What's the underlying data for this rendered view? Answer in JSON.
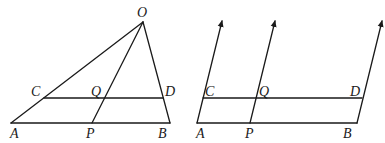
{
  "figures": [
    {
      "id": "left",
      "description": "Triangle OAB with segment CD parallel to AB and cevian OP crossing CD at Q",
      "points": {
        "O": {
          "x": 143,
          "y": 22,
          "label": "O"
        },
        "A": {
          "x": 11,
          "y": 123,
          "label": "A"
        },
        "B": {
          "x": 170,
          "y": 123,
          "label": "B"
        },
        "C": {
          "x": 44,
          "y": 98,
          "label": "C"
        },
        "D": {
          "x": 163,
          "y": 98,
          "label": "D"
        },
        "P": {
          "x": 92,
          "y": 123,
          "label": "P"
        },
        "Q": {
          "x": 104,
          "y": 98,
          "label": "Q"
        }
      },
      "segments": [
        [
          "O",
          "A"
        ],
        [
          "O",
          "B"
        ],
        [
          "O",
          "P"
        ],
        [
          "A",
          "B"
        ],
        [
          "C",
          "D"
        ]
      ]
    },
    {
      "id": "right",
      "description": "Parallel lines AB and CD cut by three parallel rays through A-C, P-Q, B-D",
      "points": {
        "A": {
          "x": 197,
          "y": 123,
          "label": "A"
        },
        "B": {
          "x": 357,
          "y": 123,
          "label": "B"
        },
        "C": {
          "x": 203,
          "y": 98,
          "label": "C"
        },
        "D": {
          "x": 362,
          "y": 98,
          "label": "D"
        },
        "P": {
          "x": 250,
          "y": 123,
          "label": "P"
        },
        "Q": {
          "x": 256,
          "y": 98,
          "label": "Q"
        }
      },
      "segments": [
        [
          "A",
          "B"
        ],
        [
          "C",
          "D"
        ]
      ],
      "rays": [
        {
          "from": "A",
          "tip": {
            "x": 222,
            "y": 19
          }
        },
        {
          "from": "P",
          "tip": {
            "x": 275,
            "y": 19
          }
        },
        {
          "from": "B",
          "tip": {
            "x": 382,
            "y": 19
          }
        }
      ]
    }
  ],
  "labels": {
    "left": {
      "O": "O",
      "A": "A",
      "B": "B",
      "C": "C",
      "D": "D",
      "P": "P",
      "Q": "Q"
    },
    "right": {
      "A": "A",
      "B": "B",
      "C": "C",
      "D": "D",
      "P": "P",
      "Q": "Q"
    }
  },
  "colors": {
    "stroke": "#1a1a1a",
    "background": "#ffffff"
  }
}
